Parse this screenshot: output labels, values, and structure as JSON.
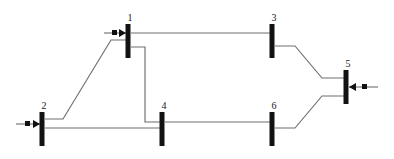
{
  "diagram": {
    "type": "single-line-diagram",
    "canvas": {
      "width": 394,
      "height": 159
    },
    "colors": {
      "background": "#ffffff",
      "bus": "#121212",
      "line": "#6e6e6e",
      "label": "#161616"
    },
    "buses": [
      {
        "id": "bus-1",
        "label": "1",
        "x": 128,
        "y_top": 24,
        "y_bottom": 58,
        "bar_width": 5,
        "label_x": 130,
        "label_y": 21
      },
      {
        "id": "bus-2",
        "label": "2",
        "x": 42,
        "y_top": 112,
        "y_bottom": 146,
        "bar_width": 5,
        "label_x": 44,
        "label_y": 109
      },
      {
        "id": "bus-3",
        "label": "3",
        "x": 272,
        "y_top": 24,
        "y_bottom": 58,
        "bar_width": 5,
        "label_x": 274,
        "label_y": 21
      },
      {
        "id": "bus-4",
        "label": "4",
        "x": 162,
        "y_top": 112,
        "y_bottom": 146,
        "bar_width": 5,
        "label_x": 164,
        "label_y": 109
      },
      {
        "id": "bus-5",
        "label": "5",
        "x": 346,
        "y_top": 70,
        "y_bottom": 104,
        "bar_width": 5,
        "label_x": 348,
        "label_y": 67
      },
      {
        "id": "bus-6",
        "label": "6",
        "x": 272,
        "y_top": 112,
        "y_bottom": 146,
        "bar_width": 5,
        "label_x": 274,
        "label_y": 109
      }
    ],
    "branches": [
      {
        "id": "branch-1-3",
        "from": "bus-1",
        "to": "bus-3",
        "path": "M 131 33 L 270 33"
      },
      {
        "id": "branch-1-4",
        "from": "bus-1",
        "to": "bus-4",
        "path": "M 131 47 L 145 47 L 145 122 L 160 122"
      },
      {
        "id": "branch-2-1",
        "from": "bus-2",
        "to": "bus-1",
        "path": "M 45 119 L 63 119 L 111 40 L 126 40"
      },
      {
        "id": "branch-2-4",
        "from": "bus-2",
        "to": "bus-4",
        "path": "M 45 128 L 160 128"
      },
      {
        "id": "branch-4-6",
        "from": "bus-4",
        "to": "bus-6",
        "path": "M 165 122 L 270 122"
      },
      {
        "id": "branch-3-5",
        "from": "bus-3",
        "to": "bus-5",
        "path": "M 275 46 L 295 46 L 322 78 L 344 78"
      },
      {
        "id": "branch-6-5",
        "from": "bus-6",
        "to": "bus-5",
        "path": "M 275 128 L 295 128 L 322 96 L 344 96"
      }
    ],
    "injections": [
      {
        "id": "injection-bus-1",
        "bus": "bus-1",
        "direction": "into-bus-from-left",
        "line_x1": 104,
        "line_x2": 126,
        "y": 33,
        "square_x": 112,
        "square_y": 30,
        "square_size": 5,
        "arrow_points": "119,29 126,33 119,37"
      },
      {
        "id": "injection-bus-2",
        "bus": "bus-2",
        "direction": "into-bus-from-left",
        "line_x1": 16,
        "line_x2": 40,
        "y": 124,
        "square_x": 25,
        "square_y": 121,
        "square_size": 5,
        "arrow_points": "33,120 40,124 33,128"
      },
      {
        "id": "injection-bus-5",
        "bus": "bus-5",
        "direction": "into-bus-from-right",
        "line_x1": 349,
        "line_x2": 378,
        "y": 87,
        "square_x": 362,
        "square_y": 84,
        "square_size": 5,
        "arrow_points": "356,83 349,87 356,91"
      }
    ]
  },
  "chart_data": {
    "type": "diagram",
    "nodes": [
      "1",
      "2",
      "3",
      "4",
      "5",
      "6"
    ],
    "edges": [
      [
        "1",
        "3"
      ],
      [
        "1",
        "4"
      ],
      [
        "2",
        "1"
      ],
      [
        "2",
        "4"
      ],
      [
        "4",
        "6"
      ],
      [
        "3",
        "5"
      ],
      [
        "6",
        "5"
      ]
    ],
    "external_injections": [
      "1",
      "2",
      "5"
    ]
  }
}
